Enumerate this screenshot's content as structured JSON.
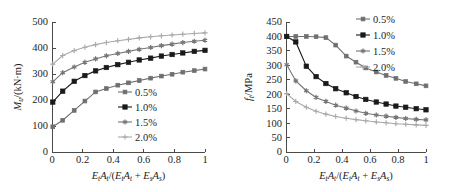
{
  "figure": {
    "background": "#ffffff",
    "panels": [
      "left",
      "right"
    ]
  },
  "colors": {
    "s05": "#6f6f6f",
    "s10": "#1a1a1a",
    "s15": "#757575",
    "s20": "#a9a9a9",
    "axis": "#4a4a4a",
    "text": "#1d1d1d"
  },
  "axis_title_parts": {
    "E": "E",
    "t": "t",
    "A": "A",
    "s": "s",
    "slash": "/(",
    "plus": " + ",
    "close": ")"
  },
  "left_panel": {
    "ylabel_main": "M",
    "ylabel_sub": "u",
    "ylabel_unit": "/(kN·m)",
    "xticks": [
      "0",
      "0.2",
      "0.4",
      "0.6",
      "0.8",
      "1"
    ],
    "yticks": [
      "0",
      "100",
      "200",
      "300",
      "400",
      "500"
    ],
    "legend": [
      "0.5%",
      "1.0%",
      "1.5%",
      "2.0%"
    ]
  },
  "right_panel": {
    "ylabel_main": "f",
    "ylabel_sub": "t",
    "ylabel_unit": "/MPa",
    "xticks": [
      "0",
      "0.2",
      "0.4",
      "0.6",
      "0.8",
      "1"
    ],
    "yticks": [
      "0",
      "50",
      "100",
      "150",
      "200",
      "250",
      "300",
      "350",
      "400",
      "450"
    ],
    "legend": [
      "0.5%",
      "1.0%",
      "1.5%",
      "2.0%"
    ]
  },
  "chart_data": [
    {
      "type": "line",
      "id": "left",
      "title": "",
      "xlabel": "EtAt/(EtAt + EsAs)",
      "ylabel": "Mu/(kN·m)",
      "xlim": [
        0,
        1
      ],
      "ylim": [
        0,
        500
      ],
      "xticks": [
        0,
        0.2,
        0.4,
        0.6,
        0.8,
        1
      ],
      "yticks": [
        0,
        100,
        200,
        300,
        400,
        500
      ],
      "grid": false,
      "legend_position": "center-right-inside",
      "series": [
        {
          "name": "0.5%",
          "marker": "square",
          "color": "#6f6f6f",
          "x": [
            0.005,
            0.07,
            0.145,
            0.215,
            0.285,
            0.355,
            0.43,
            0.5,
            0.57,
            0.645,
            0.715,
            0.785,
            0.855,
            0.93,
            1.0
          ],
          "y": [
            97,
            122,
            160,
            196,
            231,
            244,
            257,
            266,
            275,
            284,
            292,
            299,
            307,
            313,
            319
          ]
        },
        {
          "name": "1.0%",
          "marker": "square-filled",
          "color": "#1a1a1a",
          "x": [
            0.005,
            0.07,
            0.145,
            0.215,
            0.285,
            0.355,
            0.43,
            0.5,
            0.57,
            0.645,
            0.715,
            0.785,
            0.855,
            0.93,
            1.0
          ],
          "y": [
            192,
            234,
            272,
            294,
            312,
            325,
            336,
            345,
            354,
            361,
            369,
            375,
            381,
            387,
            391
          ]
        },
        {
          "name": "1.5%",
          "marker": "star",
          "color": "#757575",
          "x": [
            0.005,
            0.07,
            0.145,
            0.215,
            0.285,
            0.355,
            0.43,
            0.5,
            0.57,
            0.645,
            0.715,
            0.785,
            0.855,
            0.93,
            1.0
          ],
          "y": [
            270,
            305,
            327,
            345,
            358,
            370,
            379,
            387,
            395,
            402,
            409,
            415,
            421,
            426,
            430
          ]
        },
        {
          "name": "2.0%",
          "marker": "plus",
          "color": "#a9a9a9",
          "x": [
            0.005,
            0.07,
            0.145,
            0.215,
            0.285,
            0.355,
            0.43,
            0.5,
            0.57,
            0.645,
            0.715,
            0.785,
            0.855,
            0.93,
            1.0
          ],
          "y": [
            338,
            371,
            390,
            403,
            413,
            421,
            428,
            433,
            439,
            443,
            447,
            450,
            453,
            456,
            458
          ]
        }
      ]
    },
    {
      "type": "line",
      "id": "right",
      "title": "",
      "xlabel": "EtAt/(EtAt + EsAs)",
      "ylabel": "ft/MPa",
      "xlim": [
        0,
        1
      ],
      "ylim": [
        0,
        450
      ],
      "xticks": [
        0,
        0.2,
        0.4,
        0.6,
        0.8,
        1
      ],
      "yticks": [
        0,
        50,
        100,
        150,
        200,
        250,
        300,
        350,
        400,
        450
      ],
      "grid": false,
      "legend_position": "top-right-outside",
      "series": [
        {
          "name": "0.5%",
          "marker": "square",
          "color": "#6f6f6f",
          "x": [
            0.005,
            0.07,
            0.145,
            0.215,
            0.285,
            0.355,
            0.43,
            0.5,
            0.57,
            0.645,
            0.715,
            0.785,
            0.855,
            0.93,
            1.0
          ],
          "y": [
            400,
            400,
            400,
            399,
            396,
            370,
            332,
            311,
            291,
            277,
            265,
            255,
            244,
            236,
            229
          ]
        },
        {
          "name": "1.0%",
          "marker": "square-filled",
          "color": "#1a1a1a",
          "x": [
            0.005,
            0.07,
            0.145,
            0.215,
            0.285,
            0.355,
            0.43,
            0.5,
            0.57,
            0.645,
            0.715,
            0.785,
            0.855,
            0.93,
            1.0
          ],
          "y": [
            400,
            381,
            297,
            261,
            237,
            219,
            205,
            192,
            182,
            173,
            166,
            159,
            155,
            150,
            146
          ]
        },
        {
          "name": "1.5%",
          "marker": "star",
          "color": "#757575",
          "x": [
            0.005,
            0.07,
            0.145,
            0.215,
            0.285,
            0.355,
            0.43,
            0.5,
            0.57,
            0.645,
            0.715,
            0.785,
            0.855,
            0.93,
            1.0
          ],
          "y": [
            302,
            246,
            212,
            189,
            175,
            162,
            152,
            142,
            134,
            128,
            124,
            120,
            116,
            113,
            111
          ]
        },
        {
          "name": "2.0%",
          "marker": "plus",
          "color": "#a9a9a9",
          "x": [
            0.005,
            0.07,
            0.145,
            0.215,
            0.285,
            0.355,
            0.43,
            0.5,
            0.57,
            0.645,
            0.715,
            0.785,
            0.855,
            0.93,
            1.0
          ],
          "y": [
            202,
            175,
            155,
            141,
            131,
            123,
            117,
            112,
            108,
            104,
            101,
            98,
            96,
            94,
            92
          ]
        }
      ]
    }
  ]
}
